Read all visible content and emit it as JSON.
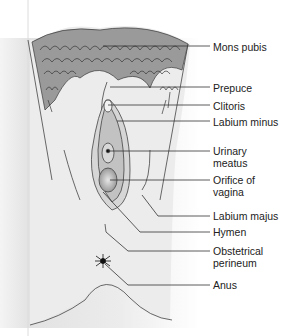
{
  "figure": {
    "caption": "",
    "labels": [
      {
        "id": "mons-pubis",
        "text": "Mons pubis",
        "y": 47
      },
      {
        "id": "prepuce",
        "text": "Prepuce",
        "y": 88
      },
      {
        "id": "clitoris",
        "text": "Clitoris",
        "y": 106
      },
      {
        "id": "labium-minus",
        "text": "Labium minus",
        "y": 122
      },
      {
        "id": "urinary-meatus",
        "text": "Urinary\nmeatus",
        "y": 150
      },
      {
        "id": "orifice-of-vagina",
        "text": "Orifice of\nvagina",
        "y": 181
      },
      {
        "id": "labium-majus",
        "text": "Labium majus",
        "y": 216
      },
      {
        "id": "hymen",
        "text": "Hymen",
        "y": 232
      },
      {
        "id": "obstetrical-perineum",
        "text": "Obstetrical\nperineum",
        "y": 251
      },
      {
        "id": "anus",
        "text": "Anus",
        "y": 285
      }
    ]
  },
  "colors": {
    "skin": "#e9e9e9",
    "shade": "#cfcfcf",
    "hair": "#555555",
    "line": "#333333",
    "inner": "#bdbdbd"
  }
}
